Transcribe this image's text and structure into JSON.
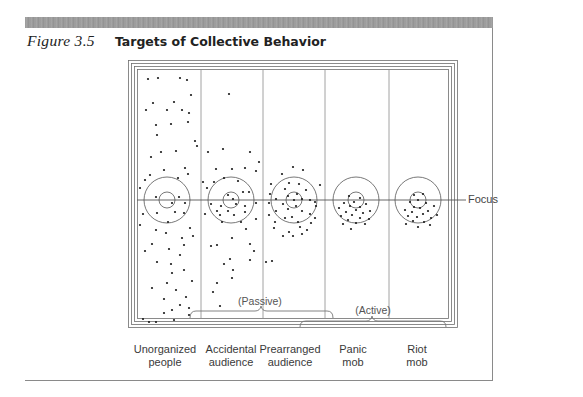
{
  "figure": {
    "number": "Figure 3.5",
    "title": "Targets of Collective Behavior"
  },
  "focus_label": "Focus",
  "groups": [
    {
      "label": "(Passive)",
      "spans": [
        "Accidental audience",
        "Prearranged audience"
      ]
    },
    {
      "label": "(Active)",
      "spans": [
        "Panic mob",
        "Riot mob"
      ]
    }
  ],
  "categories": [
    {
      "line1": "Unorganized",
      "line2": "people"
    },
    {
      "line1": "Accidental",
      "line2": "audience"
    },
    {
      "line1": "Prearranged",
      "line2": "audience"
    },
    {
      "line1": "Panic",
      "line2": "mob"
    },
    {
      "line1": "Riot",
      "line2": "mob"
    }
  ],
  "colors": {
    "header_bar": "#9e9e9e",
    "lines": "#6e6e6e",
    "dots": "#1a1a1a"
  }
}
